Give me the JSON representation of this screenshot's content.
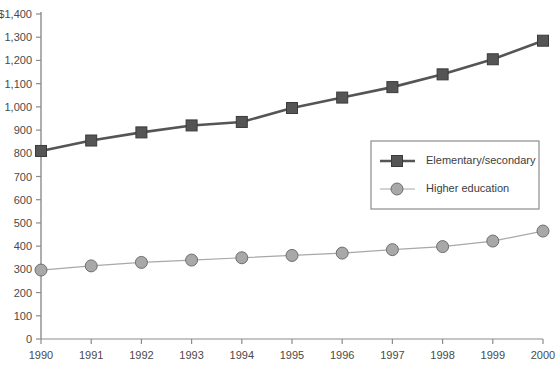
{
  "chart_data": {
    "type": "line",
    "title": "",
    "subtitle": "",
    "xlabel": "",
    "ylabel": "",
    "categories": [
      1990,
      1991,
      1992,
      1993,
      1994,
      1995,
      1996,
      1997,
      1998,
      1999,
      2000
    ],
    "x_tick_labels": [
      "1990",
      "1991",
      "1992",
      "1993",
      "1994",
      "1995",
      "1996",
      "1997",
      "1998",
      "1999",
      "2000"
    ],
    "y_tick_labels": [
      "$1,400",
      "1,300",
      "1,200",
      "1,100",
      "1,000",
      "900",
      "800",
      "700",
      "600",
      "500",
      "400",
      "300",
      "200",
      "100",
      "0"
    ],
    "y_tick_values": [
      1400,
      1300,
      1200,
      1100,
      1000,
      900,
      800,
      700,
      600,
      500,
      400,
      300,
      200,
      100,
      0
    ],
    "ylim": [
      0,
      1400
    ],
    "xlim": [
      1990,
      2000
    ],
    "grid": false,
    "legend_position": "inside-upper-right",
    "series": [
      {
        "name": "Elementary/secondary",
        "values": [
          810,
          855,
          890,
          920,
          935,
          995,
          1040,
          1085,
          1140,
          1205,
          1285
        ],
        "color": "#555555",
        "marker": "square"
      },
      {
        "name": "Higher education",
        "values": [
          297,
          315,
          330,
          340,
          350,
          360,
          370,
          385,
          398,
          422,
          465
        ],
        "color": "#a8a8a8",
        "marker": "circle"
      }
    ]
  },
  "legend": {
    "items": [
      {
        "label": "Elementary/secondary"
      },
      {
        "label": "Higher education"
      }
    ]
  },
  "colors": {
    "axis": "#8c8c8c",
    "elementary": "#555555",
    "higher_education": "#a8a8a8",
    "legend_border": "#8c8c8c",
    "text": "#3d3d3d",
    "background": "#ffffff"
  }
}
